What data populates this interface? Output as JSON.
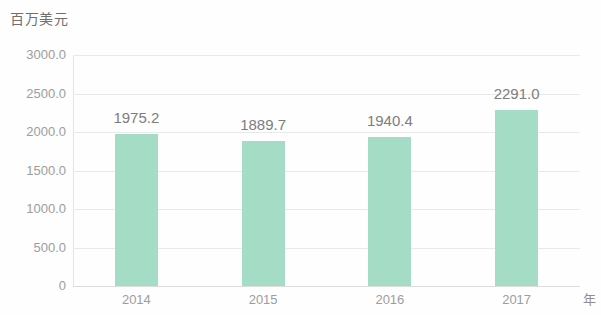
{
  "chart_data": {
    "type": "bar",
    "title": "",
    "subtitle": "",
    "xlabel": "年",
    "ylabel": "百万美元",
    "categories": [
      "2014",
      "2015",
      "2016",
      "2017"
    ],
    "values": [
      1975.2,
      1889.7,
      1940.4,
      2291.0
    ],
    "value_labels": [
      "1975.2",
      "1889.7",
      "1940.4",
      "2291.0"
    ],
    "series": [
      {
        "name": "",
        "values": [
          1975.2,
          1889.7,
          1940.4,
          2291.0
        ]
      }
    ],
    "ylim": [
      0,
      3000
    ],
    "ytick_values": [
      0,
      500,
      1000,
      1500,
      2000,
      2500,
      3000
    ],
    "ytick_labels": [
      "0",
      "500.0",
      "1000.0",
      "1500.0",
      "2000.0",
      "2500.0",
      "3000.0"
    ],
    "grid": true,
    "grid_axis": "y",
    "legend": false,
    "legend_position": "none",
    "bar_color": "#a5dcc6",
    "text_color": "#8a8a8a",
    "grid_color": "#e9e9e9",
    "background_color": "#ffffff"
  },
  "axis": {
    "unit_label": "百万美元",
    "x_unit_label": "年"
  }
}
